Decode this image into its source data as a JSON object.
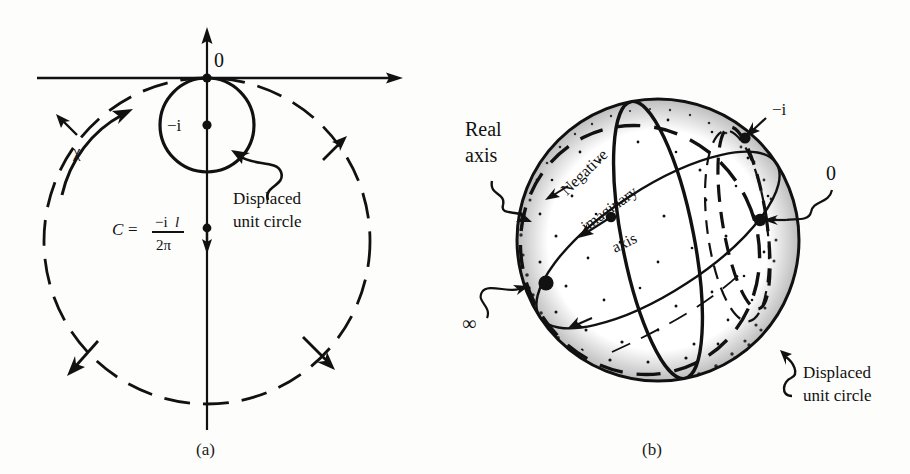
{
  "figure": {
    "type": "diagram",
    "background_color": "#fdfdfc",
    "ink_color": "#111111"
  },
  "panel_a": {
    "caption": "(a)",
    "axes": {
      "real_axis_arrow": "arrow-right",
      "imaginary_axis_arrow": "arrow-up",
      "origin_label": "0"
    },
    "labels": {
      "minus_i": "−i",
      "chi": "χ",
      "displaced_unit_circle_line1": "Displaced",
      "displaced_unit_circle_line2": "unit circle",
      "formula_lhs": "C",
      "formula_equals": "=",
      "formula_numerator": "−i",
      "formula_numerator_italic": "l",
      "formula_denominator": "2π"
    },
    "geometry": {
      "origin_point": [
        207,
        78
      ],
      "small_circle_center": [
        207,
        125
      ],
      "small_circle_radius": 47,
      "big_circle_center": [
        207,
        241
      ],
      "big_circle_radius": 163,
      "c_point": [
        207,
        228
      ]
    }
  },
  "panel_b": {
    "caption": "(b)",
    "labels": {
      "real_axis_line1": "Real",
      "real_axis_line2": "axis",
      "negative_imaginary_axis_line1": "Negative",
      "negative_imaginary_axis_line2": "imaginary",
      "negative_imaginary_axis_line3": "axis",
      "minus_i": "−i",
      "zero": "0",
      "infinity": "∞",
      "displaced_unit_circle_line1": "Displaced",
      "displaced_unit_circle_line2": "unit circle"
    },
    "geometry": {
      "sphere_center": [
        658,
        240
      ],
      "sphere_radius": 142,
      "point_minus_i": [
        745,
        138
      ],
      "point_zero": [
        760,
        220
      ],
      "point_infinity": [
        546,
        283
      ],
      "point_mid_axis": [
        611,
        217
      ]
    }
  }
}
